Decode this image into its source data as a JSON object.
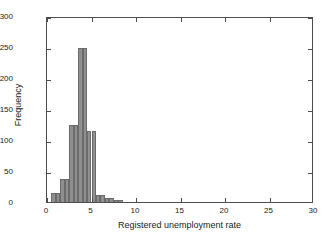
{
  "chart_data": {
    "type": "bar",
    "title": "",
    "subtitle": "",
    "xlabel": "Registered unemployment rate",
    "ylabel": "Frequency",
    "xlim": [
      0,
      30
    ],
    "ylim": [
      0,
      300
    ],
    "xticks": [
      0,
      5,
      10,
      15,
      20,
      25,
      30
    ],
    "yticks": [
      0,
      50,
      100,
      150,
      200,
      250,
      300
    ],
    "grid": false,
    "legend": null,
    "bin_width": 0.5,
    "bar_color": "#8f8f8f",
    "bar_edge_color": "#6b6b6b",
    "axis_color": "#4d4d4d",
    "bins": [
      {
        "left": 0.5,
        "right": 1.0,
        "center": 0.75,
        "value": 15
      },
      {
        "left": 1.0,
        "right": 1.5,
        "center": 1.25,
        "value": 15
      },
      {
        "left": 1.5,
        "right": 2.0,
        "center": 1.75,
        "value": 37
      },
      {
        "left": 2.0,
        "right": 2.5,
        "center": 2.25,
        "value": 37
      },
      {
        "left": 2.5,
        "right": 3.0,
        "center": 2.75,
        "value": 124
      },
      {
        "left": 3.0,
        "right": 3.5,
        "center": 3.25,
        "value": 124
      },
      {
        "left": 3.5,
        "right": 4.0,
        "center": 3.75,
        "value": 248
      },
      {
        "left": 4.0,
        "right": 4.5,
        "center": 4.25,
        "value": 248
      },
      {
        "left": 4.5,
        "right": 5.0,
        "center": 4.75,
        "value": 114
      },
      {
        "left": 5.0,
        "right": 5.5,
        "center": 5.25,
        "value": 114
      },
      {
        "left": 5.5,
        "right": 6.0,
        "center": 5.75,
        "value": 12
      },
      {
        "left": 6.0,
        "right": 6.5,
        "center": 6.25,
        "value": 12
      },
      {
        "left": 6.5,
        "right": 7.0,
        "center": 6.75,
        "value": 6
      },
      {
        "left": 7.0,
        "right": 7.5,
        "center": 7.25,
        "value": 6
      },
      {
        "left": 7.5,
        "right": 8.0,
        "center": 7.75,
        "value": 3
      },
      {
        "left": 8.0,
        "right": 8.5,
        "center": 8.25,
        "value": 3
      }
    ],
    "categories": [
      "0.75",
      "1.25",
      "1.75",
      "2.25",
      "2.75",
      "3.25",
      "3.75",
      "4.25",
      "4.75",
      "5.25",
      "5.75",
      "6.25",
      "6.75",
      "7.25",
      "7.75",
      "8.25"
    ],
    "values": [
      15,
      15,
      37,
      37,
      124,
      124,
      248,
      248,
      114,
      114,
      12,
      12,
      6,
      6,
      3,
      3
    ]
  }
}
